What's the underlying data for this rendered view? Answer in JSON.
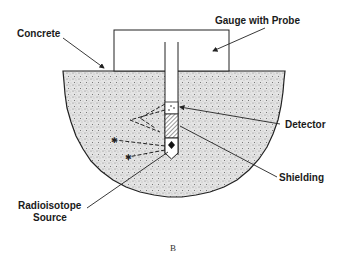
{
  "diagram": {
    "labels": {
      "concrete": "Concrete",
      "gauge": "Gauge with Probe",
      "detector": "Detector",
      "shielding": "Shielding",
      "source_line1": "Radioisotope",
      "source_line2": "Source"
    },
    "caption": "B",
    "colors": {
      "line": "#222222",
      "concrete_fill": "#d9d9d9",
      "background": "#ffffff"
    }
  }
}
